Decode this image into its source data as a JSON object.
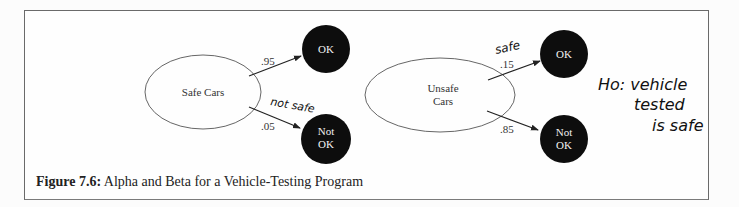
{
  "figure": {
    "caption_label": "Figure 7.6:",
    "caption_text": "Alpha and Beta for a Vehicle-Testing Program"
  },
  "nodes": {
    "safe_cars": {
      "label": "Safe Cars"
    },
    "unsafe_cars": {
      "label_line1": "Unsafe",
      "label_line2": "Cars"
    },
    "safe_ok": {
      "label": "OK"
    },
    "safe_not_ok": {
      "label_line1": "Not",
      "label_line2": "OK"
    },
    "unsafe_ok": {
      "label": "OK"
    },
    "unsafe_not_ok": {
      "label_line1": "Not",
      "label_line2": "OK"
    }
  },
  "edges": {
    "safe_to_ok": {
      "probability": ".95"
    },
    "safe_to_not_ok": {
      "probability": ".05",
      "annotation": "not safe"
    },
    "unsafe_to_ok": {
      "probability": ".15",
      "annotation": "safe"
    },
    "unsafe_to_not_ok": {
      "probability": ".85"
    }
  },
  "handwritten_note": {
    "line1": "Ho: vehicle",
    "line2": "tested",
    "line3": "is safe"
  },
  "colors": {
    "node_fill_dark": "#0d0d0d",
    "frame_border": "#6a6a6a",
    "edge": "#222222"
  }
}
